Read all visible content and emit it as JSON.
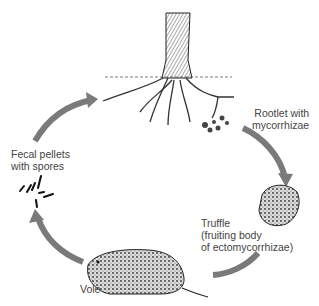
{
  "diagram": {
    "type": "life-cycle",
    "arrow_color": "#7a7a7a",
    "nodes": [
      {
        "id": "tree",
        "label": "",
        "icon": "tree-with-roots"
      },
      {
        "id": "rootlet",
        "label_lines": [
          "Rootlet with",
          "mycorrhizae"
        ]
      },
      {
        "id": "truffle",
        "label_lines": [
          "Truffle",
          "(fruiting body",
          "of ectomycorrhizae)"
        ]
      },
      {
        "id": "vole",
        "label_lines": [
          "Vole"
        ]
      },
      {
        "id": "pellets",
        "label_lines": [
          "Fecal pellets",
          "with spores"
        ]
      }
    ],
    "edges": [
      {
        "from": "rootlet",
        "to": "truffle"
      },
      {
        "from": "truffle",
        "to": "vole"
      },
      {
        "from": "vole",
        "to": "pellets"
      },
      {
        "from": "pellets",
        "to": "tree"
      }
    ]
  }
}
